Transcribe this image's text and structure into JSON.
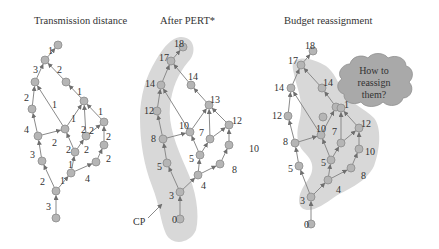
{
  "panels": [
    {
      "id": "transmission",
      "title": "Transmission distance",
      "title_pos": [
        34,
        24
      ],
      "nodes": {
        "A": [
          58,
          45
        ],
        "B": [
          45,
          60
        ],
        "C": [
          35,
          82
        ],
        "D": [
          66,
          82
        ],
        "E": [
          32,
          109
        ],
        "F": [
          84,
          101
        ],
        "G": [
          38,
          136
        ],
        "H": [
          65,
          129
        ],
        "I": [
          104,
          122
        ],
        "J": [
          86,
          136
        ],
        "K": [
          42,
          161
        ],
        "L": [
          75,
          152
        ],
        "M": [
          104,
          145
        ],
        "N": [
          96,
          162
        ],
        "O": [
          71,
          173
        ],
        "P": [
          56,
          191
        ],
        "Q": [
          56,
          218
        ]
      },
      "edges": [
        [
          "B",
          "A"
        ],
        [
          "C",
          "B"
        ],
        [
          "D",
          "B"
        ],
        [
          "E",
          "C"
        ],
        [
          "H",
          "C"
        ],
        [
          "F",
          "D"
        ],
        [
          "G",
          "E"
        ],
        [
          "H",
          "F"
        ],
        [
          "J",
          "F"
        ],
        [
          "I",
          "F"
        ],
        [
          "G",
          "H"
        ],
        [
          "L",
          "H"
        ],
        [
          "L",
          "J"
        ],
        [
          "J",
          "I"
        ],
        [
          "M",
          "I"
        ],
        [
          "N",
          "M"
        ],
        [
          "K",
          "G"
        ],
        [
          "O",
          "L"
        ],
        [
          "O",
          "N"
        ],
        [
          "P",
          "K"
        ],
        [
          "P",
          "O"
        ],
        [
          "Q",
          "P"
        ]
      ],
      "labels": [
        {
          "text": "1",
          "x": 48,
          "y": 51
        },
        {
          "text": "3",
          "x": 33,
          "y": 70
        },
        {
          "text": "2",
          "x": 57,
          "y": 70
        },
        {
          "text": "1",
          "x": 77,
          "y": 92
        },
        {
          "text": "2",
          "x": 24,
          "y": 98
        },
        {
          "text": "1",
          "x": 52,
          "y": 105
        },
        {
          "text": "1",
          "x": 71,
          "y": 119
        },
        {
          "text": "1",
          "x": 98,
          "y": 112
        },
        {
          "text": "4",
          "x": 24,
          "y": 130
        },
        {
          "text": "2",
          "x": 81,
          "y": 130
        },
        {
          "text": "2",
          "x": 89,
          "y": 131
        },
        {
          "text": "2",
          "x": 52,
          "y": 143
        },
        {
          "text": "2",
          "x": 106,
          "y": 137
        },
        {
          "text": "2",
          "x": 66,
          "y": 150
        },
        {
          "text": "2",
          "x": 84,
          "y": 150
        },
        {
          "text": "3",
          "x": 30,
          "y": 155
        },
        {
          "text": "2",
          "x": 106,
          "y": 159
        },
        {
          "text": "1",
          "x": 68,
          "y": 165
        },
        {
          "text": "2",
          "x": 40,
          "y": 182
        },
        {
          "text": "1",
          "x": 60,
          "y": 181
        },
        {
          "text": "4",
          "x": 85,
          "y": 179
        },
        {
          "text": "3",
          "x": 46,
          "y": 207
        }
      ]
    },
    {
      "id": "pert",
      "title": "After PERT*",
      "title_pos": [
        160,
        24
      ],
      "nodes": {
        "n18": [
          183,
          47
        ],
        "n17": [
          171,
          61
        ],
        "n14L": [
          161,
          85
        ],
        "n14M": [
          191,
          85
        ],
        "n13": [
          209,
          105
        ],
        "n12L": [
          157,
          111
        ],
        "n12R": [
          229,
          125
        ],
        "n10": [
          190,
          132
        ],
        "n7": [
          210,
          139
        ],
        "n8": [
          163,
          139
        ],
        "n10R": [
          229,
          145
        ],
        "n5M": [
          200,
          155
        ],
        "n5L": [
          167,
          163
        ],
        "n8R": [
          220,
          164
        ],
        "n4": [
          198,
          175
        ],
        "n3": [
          180,
          192
        ],
        "n0": [
          180,
          219
        ]
      },
      "edges": [
        [
          "n17",
          "n18"
        ],
        [
          "n14L",
          "n17"
        ],
        [
          "n14M",
          "n17"
        ],
        [
          "n12L",
          "n14L"
        ],
        [
          "n10",
          "n14L"
        ],
        [
          "n13",
          "n14M"
        ],
        [
          "n10",
          "n13"
        ],
        [
          "n7",
          "n13"
        ],
        [
          "n12R",
          "n13"
        ],
        [
          "n8",
          "n12L"
        ],
        [
          "n8",
          "n10"
        ],
        [
          "n5M",
          "n10"
        ],
        [
          "n7",
          "n12R"
        ],
        [
          "n10R",
          "n12R"
        ],
        [
          "n5M",
          "n7"
        ],
        [
          "n5L",
          "n8"
        ],
        [
          "n8R",
          "n10R"
        ],
        [
          "n4",
          "n5M"
        ],
        [
          "n4",
          "n8R"
        ],
        [
          "n3",
          "n5L"
        ],
        [
          "n3",
          "n4"
        ],
        [
          "n0",
          "n3"
        ]
      ],
      "labels": [
        {
          "text": "18",
          "x": 174,
          "y": 44
        },
        {
          "text": "17",
          "x": 159,
          "y": 58
        },
        {
          "text": "14",
          "x": 145,
          "y": 84
        },
        {
          "text": "14",
          "x": 188,
          "y": 77
        },
        {
          "text": "13",
          "x": 210,
          "y": 100
        },
        {
          "text": "12",
          "x": 144,
          "y": 111
        },
        {
          "text": "12",
          "x": 232,
          "y": 121
        },
        {
          "text": "10",
          "x": 179,
          "y": 126
        },
        {
          "text": "7",
          "x": 199,
          "y": 133
        },
        {
          "text": "8",
          "x": 151,
          "y": 139
        },
        {
          "text": "10",
          "x": 249,
          "y": 149
        },
        {
          "text": "5",
          "x": 189,
          "y": 159
        },
        {
          "text": "5",
          "x": 157,
          "y": 167
        },
        {
          "text": "8",
          "x": 232,
          "y": 170
        },
        {
          "text": "4",
          "x": 201,
          "y": 186
        },
        {
          "text": "3",
          "x": 169,
          "y": 196
        },
        {
          "text": "0",
          "x": 172,
          "y": 220
        }
      ],
      "cp_label": "CP",
      "cp_pos": [
        133,
        225
      ]
    },
    {
      "id": "budget",
      "title": "Budget reassignment",
      "title_pos": [
        284,
        24
      ],
      "nodes": {
        "b18": [
          313,
          51
        ],
        "b17": [
          301,
          65
        ],
        "b14L": [
          291,
          88
        ],
        "b14M": [
          322,
          88
        ],
        "b1a": [
          336,
          107
        ],
        "b1b": [
          341,
          108
        ],
        "b12L": [
          288,
          116
        ],
        "b10f": [
          323,
          117
        ],
        "b12R": [
          359,
          128
        ],
        "b10M": [
          321,
          135
        ],
        "b8": [
          295,
          143
        ],
        "b7": [
          341,
          143
        ],
        "b10R": [
          359,
          149
        ],
        "b5M": [
          331,
          160
        ],
        "b5L": [
          299,
          166
        ],
        "b8R": [
          351,
          168
        ],
        "b4": [
          328,
          180
        ],
        "b3": [
          311,
          197
        ],
        "b0": [
          311,
          224
        ]
      },
      "edges": [
        [
          "b17",
          "b18"
        ],
        [
          "b14L",
          "b17"
        ],
        [
          "b14M",
          "b17"
        ],
        [
          "b12L",
          "b14L"
        ],
        [
          "b10M",
          "b14L"
        ],
        [
          "b1a",
          "b14M"
        ],
        [
          "b10M",
          "b1a"
        ],
        [
          "b7",
          "b1b"
        ],
        [
          "b12R",
          "b1b"
        ],
        [
          "b8",
          "b12L"
        ],
        [
          "b8",
          "b10M"
        ],
        [
          "b5M",
          "b10M"
        ],
        [
          "b7",
          "b12R"
        ],
        [
          "b10R",
          "b12R"
        ],
        [
          "b5M",
          "b7"
        ],
        [
          "b5L",
          "b8"
        ],
        [
          "b8R",
          "b10R"
        ],
        [
          "b4",
          "b5M"
        ],
        [
          "b4",
          "b8R"
        ],
        [
          "b3",
          "b5L"
        ],
        [
          "b3",
          "b4"
        ],
        [
          "b0",
          "b3"
        ]
      ],
      "labels": [
        {
          "text": "18",
          "x": 305,
          "y": 46
        },
        {
          "text": "17",
          "x": 288,
          "y": 61
        },
        {
          "text": "14",
          "x": 274,
          "y": 88
        },
        {
          "text": "14",
          "x": 323,
          "y": 83
        },
        {
          "text": "1",
          "x": 344,
          "y": 105
        },
        {
          "text": "12",
          "x": 272,
          "y": 116
        },
        {
          "text": "12",
          "x": 361,
          "y": 124
        },
        {
          "text": "10",
          "x": 316,
          "y": 129
        },
        {
          "text": "7",
          "x": 332,
          "y": 132
        },
        {
          "text": "8",
          "x": 283,
          "y": 142
        },
        {
          "text": "10",
          "x": 365,
          "y": 152
        },
        {
          "text": "5",
          "x": 321,
          "y": 163
        },
        {
          "text": "5",
          "x": 288,
          "y": 169
        },
        {
          "text": "8",
          "x": 361,
          "y": 176
        },
        {
          "text": "4",
          "x": 336,
          "y": 190
        },
        {
          "text": "3",
          "x": 300,
          "y": 201
        },
        {
          "text": "0",
          "x": 304,
          "y": 225
        }
      ],
      "cloud": {
        "lines": [
          "How to",
          "reassign",
          "them?"
        ],
        "center": [
          373,
          82
        ]
      }
    }
  ],
  "colors": {
    "shade": "#d8d8d8",
    "cloud_fill": "#a9a9a9",
    "node_fill": "#b5b5b5",
    "edge": "#8a8a8a",
    "text": "#333333"
  }
}
